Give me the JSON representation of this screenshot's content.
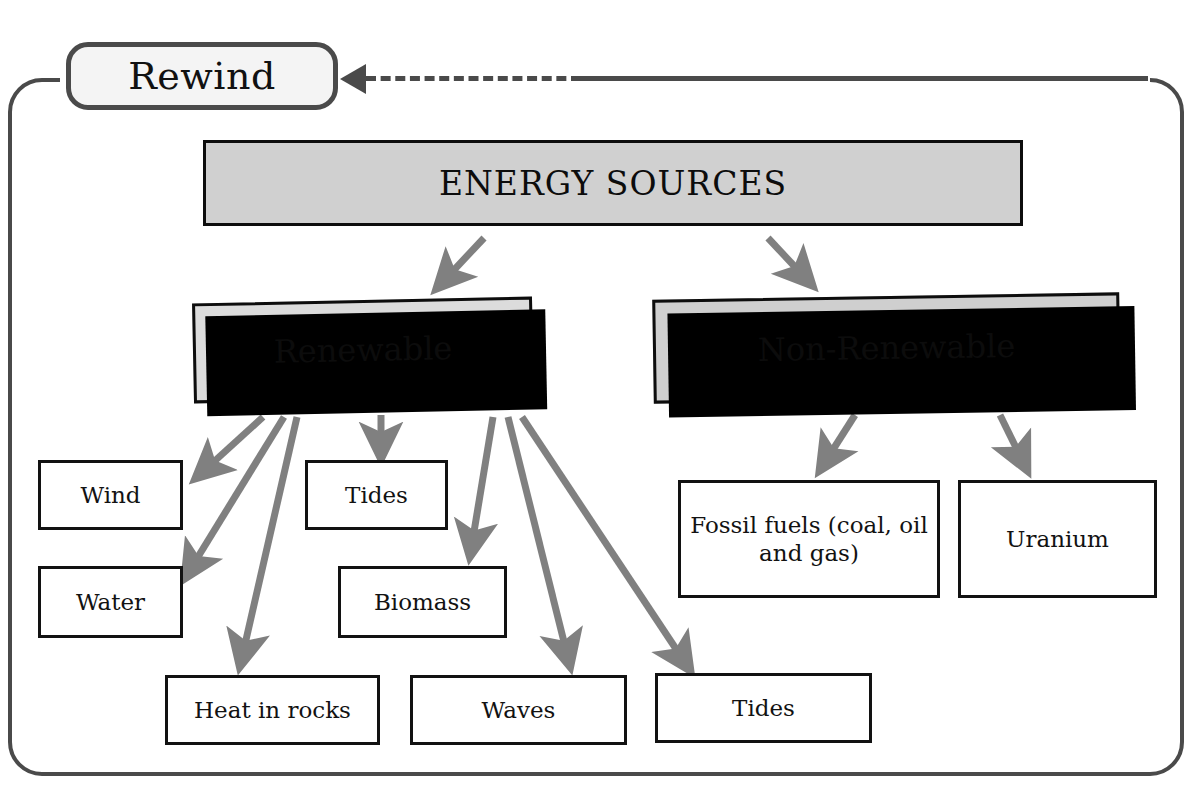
{
  "rewind": {
    "label": "Rewind"
  },
  "diagram": {
    "root": {
      "label": "ENERGY SOURCES"
    },
    "categories": [
      {
        "label": "Renewable"
      },
      {
        "label": "Non-Renewable"
      }
    ],
    "renewable_items": [
      {
        "label": "Wind"
      },
      {
        "label": "Tides"
      },
      {
        "label": "Water"
      },
      {
        "label": "Biomass"
      },
      {
        "label": "Heat in rocks"
      },
      {
        "label": "Waves"
      },
      {
        "label": "Tides"
      }
    ],
    "non_renewable_items": [
      {
        "label": "Fossil fuels (coal, oil and gas)"
      },
      {
        "label": "Uranium"
      }
    ]
  },
  "colors": {
    "frame_border": "#4a4a4a",
    "arrow": "#808080",
    "root_fill": "#d0d0d0",
    "category_fill": "#dcdcdc",
    "leaf_fill": "#ffffff",
    "text": "#111111",
    "shadow": "#000000"
  }
}
